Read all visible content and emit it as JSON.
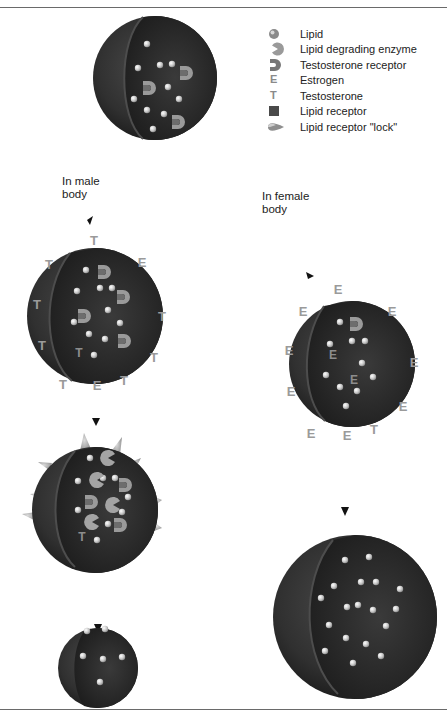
{
  "legend": {
    "items": [
      {
        "icon": "lipid-icon",
        "label": "Lipid"
      },
      {
        "icon": "lipid-degrading-enzyme-icon",
        "label": "Lipid degrading enzyme"
      },
      {
        "icon": "testosterone-receptor-icon",
        "label": "Testosterone receptor"
      },
      {
        "icon": "estrogen-icon",
        "label": "Estrogen",
        "glyph": "E"
      },
      {
        "icon": "testosterone-icon",
        "label": "Testosterone",
        "glyph": "T"
      },
      {
        "icon": "lipid-receptor-icon",
        "label": "Lipid receptor"
      },
      {
        "icon": "lipid-receptor-lock-icon",
        "label": "Lipid receptor \"lock\""
      }
    ]
  },
  "captions": {
    "male": "In male\nbody",
    "female": "In female\nbody"
  },
  "colors": {
    "sphere_dark": "#2a2a2a",
    "sphere_mid": "#3c3c3c",
    "molecule_gray": "#9a9a9a",
    "rule": "#6a6a6a"
  },
  "glyphs": {
    "estrogen": "E",
    "testosterone": "T"
  },
  "scenes": {
    "initial_cell": {
      "lipids": 12,
      "testosterone_receptors": 3
    },
    "male_step1": {
      "outside": [
        "T",
        "E",
        "T",
        "T",
        "T",
        "T",
        "T",
        "E",
        "T",
        "T"
      ],
      "inside": [
        "T"
      ],
      "testosterone_receptors": 4,
      "lipids": 10
    },
    "male_step2": {
      "lipid_degrading_enzymes": 8,
      "lipid_receptor_locks": 10,
      "inside": [
        "T"
      ]
    },
    "male_step3": {
      "lipids": 6
    },
    "female_step1": {
      "outside": [
        "E",
        "E",
        "E",
        "E",
        "E",
        "E",
        "E",
        "E",
        "E",
        "T"
      ],
      "inside": [
        "E",
        "E"
      ],
      "testosterone_receptors": 1,
      "lipids": 11
    },
    "female_step2": {
      "lipids": 22
    }
  }
}
